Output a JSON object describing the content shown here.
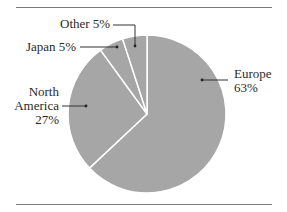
{
  "chart_data": {
    "type": "pie",
    "title": "",
    "categories": [
      "Europe",
      "North America",
      "Japan",
      "Other"
    ],
    "values": [
      63,
      27,
      5,
      5
    ],
    "unit": "%",
    "labels": [
      {
        "name": "Europe",
        "value_text": "63%"
      },
      {
        "name": "North America",
        "value_text": "27%"
      },
      {
        "name": "Japan",
        "value_text": "5%"
      },
      {
        "name": "Other",
        "value_text": "5%"
      }
    ],
    "start_angle_deg": 0,
    "direction": "clockwise",
    "legend": "none (leader-line labels)",
    "colors": {
      "slice_fill": "#a6a6a6",
      "separator": "#ffffff",
      "leader": "#333333",
      "rule": "#7a7a7a"
    }
  },
  "labels": {
    "europe_name": "Europe",
    "europe_value": "63%",
    "na_line1": "North",
    "na_line2": "America",
    "na_value": "27%",
    "japan": "Japan  5%",
    "other": "Other  5%"
  }
}
